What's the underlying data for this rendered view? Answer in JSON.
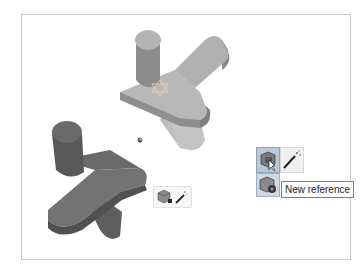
{
  "viewport": {
    "background": "#ffffff",
    "frame_border": "#c8c8c8"
  },
  "parts": [
    {
      "name": "light-part",
      "color": "#a9a9a9",
      "state": "selected-with-axis-triad"
    },
    {
      "name": "dark-part",
      "color": "#6e6e6e",
      "state": "reference"
    }
  ],
  "mini_toolbar": {
    "icons": [
      "cube-add-icon",
      "magic-wand-icon"
    ]
  },
  "popup_toolbar": {
    "buttons": [
      {
        "icon": "cube-reference-icon",
        "state": "hovered"
      },
      {
        "icon": "magic-wand-icon"
      },
      {
        "icon": "new-reference-icon"
      }
    ],
    "tooltip": "New reference"
  }
}
